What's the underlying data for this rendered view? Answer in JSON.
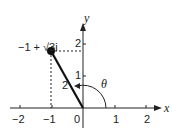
{
  "diagram": {
    "type": "complex-plane",
    "point": {
      "label": "−1 + √3i",
      "re": -1,
      "im": 1.732
    },
    "modulus_label": "2",
    "angle_label": "θ",
    "axes": {
      "x_label": "x",
      "y_label": "y",
      "x_ticks": [
        "−2",
        "−1",
        "0",
        "1",
        "2"
      ],
      "y_ticks": [
        "1",
        "2"
      ]
    }
  }
}
